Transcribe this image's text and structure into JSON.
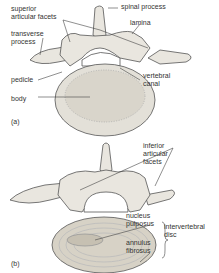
{
  "panel_a": {
    "tag": "(a)",
    "labels": {
      "superior_articular_facets": "superior\narticular facets",
      "transverse_process": "transverse\nprocess",
      "spinal_process": "spinal process",
      "lamina": "lamina",
      "pedicle": "pedicle",
      "vertebral_canal": "vertebral\ncanal",
      "body": "body"
    }
  },
  "panel_b": {
    "tag": "(b)",
    "labels": {
      "inferior_articular_facets": "inferior\narticular\nfacets",
      "nucleus_pulposus": "nucleus\npulposus",
      "annulus_fibrosus": "annulus\nfibrosus",
      "intervertebral_disc": "intervertebral\ndisc"
    }
  },
  "colors": {
    "ink": "#333333",
    "bone": "#e9e6df",
    "shade": "#b9b4aa",
    "disc": "#d7d2c6"
  }
}
